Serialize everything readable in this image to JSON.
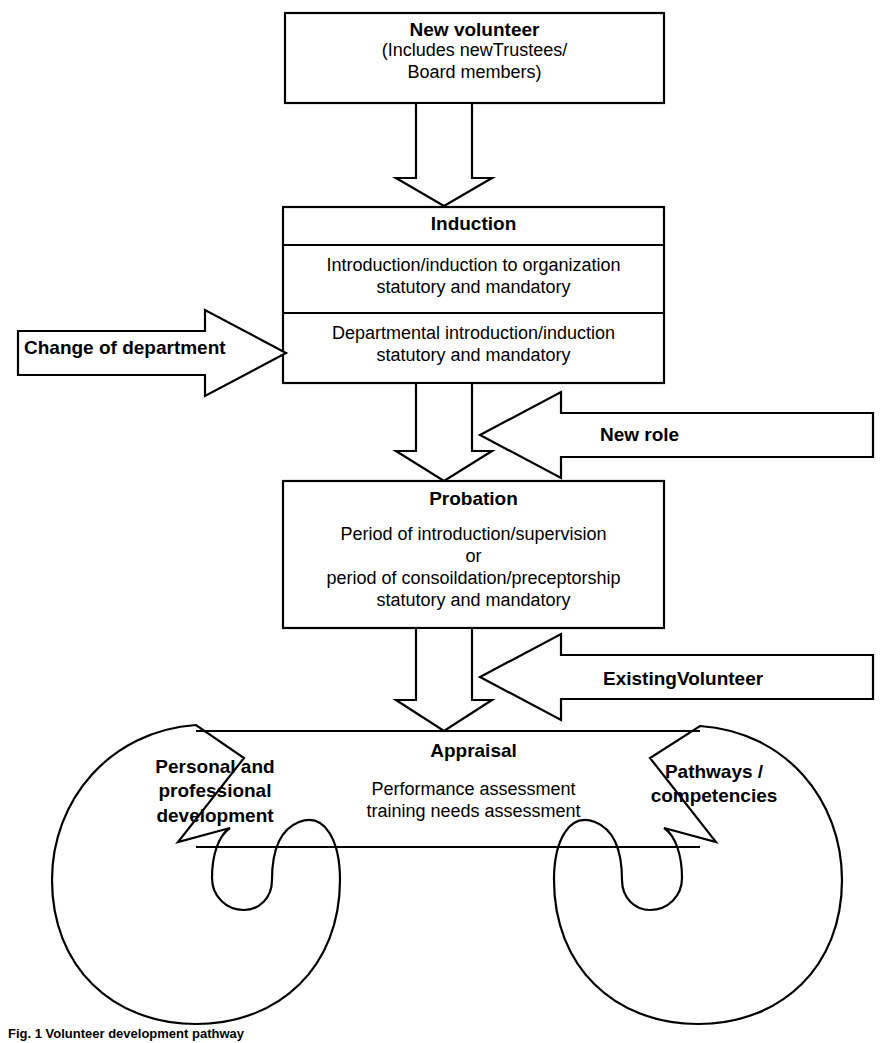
{
  "figure": {
    "caption": "Fig. 1  Volunteer development pathway",
    "type": "flowchart"
  },
  "nodes": {
    "new_volunteer": {
      "title": "New volunteer",
      "sub_line1": "(Includes newTrustees/",
      "sub_line2": "Board members)"
    },
    "induction": {
      "title": "Induction",
      "row1_line1": "Introduction/induction to organization",
      "row1_line2": "statutory and mandatory",
      "row2_line1": "Departmental introduction/induction",
      "row2_line2": "statutory and mandatory"
    },
    "probation": {
      "title": "Probation",
      "line1": "Period of introduction/supervision",
      "line2": "or",
      "line3": "period of consoildation/preceptorship",
      "line4": "statutory and mandatory"
    },
    "appraisal": {
      "title": "Appraisal",
      "line1": "Performance assessment",
      "line2": "training needs assessment"
    }
  },
  "entry_arrows": {
    "change_of_department": "Change of department",
    "new_role": "New role",
    "existing_volunteer": "ExistingVolunteer"
  },
  "loops": {
    "left": {
      "line1": "Personal and",
      "line2": "professional",
      "line3": "development"
    },
    "right": {
      "line1": "Pathways /",
      "line2": "competencies"
    }
  },
  "colors": {
    "stroke": "#000000",
    "fill": "#ffffff",
    "background": "#ffffff"
  }
}
